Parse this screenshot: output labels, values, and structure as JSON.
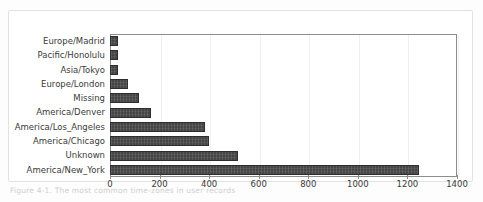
{
  "figure": {
    "caption": "Figure 4-1. The most common time-zones in user records",
    "background": "#ffffff",
    "frame_color": "#e2e2e2",
    "bar_color": "#454545",
    "axis_color": "#8d8d8d",
    "grid_color": "#f0f0f0"
  },
  "chart_data": {
    "type": "bar",
    "orientation": "horizontal",
    "title": "",
    "xlabel": "",
    "ylabel": "",
    "xlim": [
      0,
      1400
    ],
    "ylim": [
      0,
      10
    ],
    "grid": true,
    "legend": null,
    "categories": [
      "Europe/Madrid",
      "Pacific/Honolulu",
      "Asia/Tokyo",
      "Europe/London",
      "Missing",
      "America/Denver",
      "America/Los_Angeles",
      "America/Chicago",
      "Unknown",
      "America/New_York"
    ],
    "values": [
      32,
      32,
      32,
      73,
      117,
      165,
      383,
      400,
      516,
      1247
    ],
    "xticks": [
      0,
      200,
      400,
      600,
      800,
      1000,
      1200,
      1400
    ],
    "xticklabels": [
      "0",
      "200",
      "400",
      "600",
      "800",
      "1000",
      "1200",
      "1400"
    ]
  }
}
